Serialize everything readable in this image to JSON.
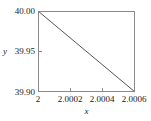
{
  "chart_data": {
    "type": "line",
    "title": "",
    "xlabel": "x",
    "ylabel": "y",
    "xlim": [
      2.0,
      2.0006
    ],
    "ylim": [
      39.9,
      40.0
    ],
    "grid": false,
    "legend": null,
    "xticks": [
      2.0,
      2.0002,
      2.0004,
      2.0006
    ],
    "xtick_labels": [
      "2",
      "2.0002",
      "2.0004",
      "2.0006"
    ],
    "yticks": [
      39.9,
      39.95,
      40.0
    ],
    "ytick_labels": [
      "39.90",
      "39.95",
      "40.00"
    ],
    "series": [
      {
        "name": "",
        "color": "#555555",
        "x": [
          2.0,
          2.0006
        ],
        "y": [
          40.0,
          39.9
        ]
      }
    ]
  },
  "axes": {
    "y_title": "y",
    "x_title": "x",
    "ytick_top": "40.00",
    "ytick_mid": "39.95",
    "ytick_bottom": "39.90",
    "xtick_0": "2",
    "xtick_1": "2.0002",
    "xtick_2": "2.0004",
    "xtick_3": "2.0006"
  },
  "colors": {
    "line": "#555555",
    "frame": "#8a8a8a",
    "text": "#1a1a1a",
    "background": "#ffffff"
  }
}
